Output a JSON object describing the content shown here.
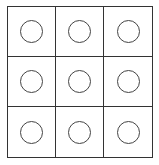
{
  "board": {
    "rows": 3,
    "cols": 3,
    "line_color": "#333333",
    "cells": [
      {
        "row": 0,
        "col": 0,
        "mark": "circle-empty"
      },
      {
        "row": 0,
        "col": 1,
        "mark": "circle-empty"
      },
      {
        "row": 0,
        "col": 2,
        "mark": "circle-empty"
      },
      {
        "row": 1,
        "col": 0,
        "mark": "circle-empty"
      },
      {
        "row": 1,
        "col": 1,
        "mark": "circle-empty"
      },
      {
        "row": 1,
        "col": 2,
        "mark": "circle-empty"
      },
      {
        "row": 2,
        "col": 0,
        "mark": "circle-empty"
      },
      {
        "row": 2,
        "col": 1,
        "mark": "circle-empty"
      },
      {
        "row": 2,
        "col": 2,
        "mark": "circle-empty"
      }
    ]
  }
}
